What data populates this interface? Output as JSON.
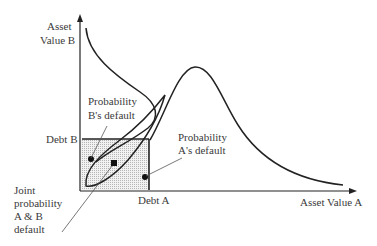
{
  "diagram": {
    "axes": {
      "y_label_line1": "Asset",
      "y_label_line2": "Value B",
      "x_label": "Asset Value A"
    },
    "thresholds": {
      "debt_b": "Debt B",
      "debt_a": "Debt A"
    },
    "annotations": {
      "prob_b_line1": "Probability",
      "prob_b_line2": "B's default",
      "prob_a_line1": "Probability",
      "prob_a_line2": "A's default",
      "joint_line1": "Joint",
      "joint_line2": "probability",
      "joint_line3": "A & B",
      "joint_line4": "default"
    },
    "colors": {
      "ink": "#222222",
      "shade": "#c8c8c8",
      "leader": "#555555"
    }
  }
}
